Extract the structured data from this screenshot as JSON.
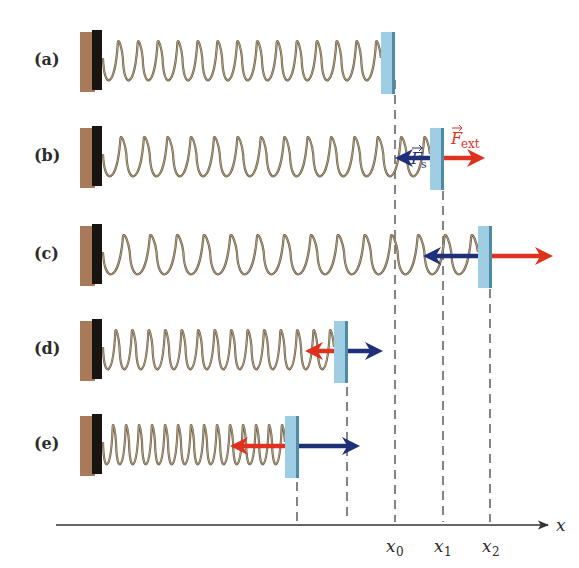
{
  "figure": {
    "colors": {
      "wall_brown": "#a87a5a",
      "wall_dark": "#1a1410",
      "plate_blue": "#9fcde3",
      "plate_edge": "#4f8aa6",
      "spring": "#6b5a40",
      "force_spring_blue": "#1f2f7a",
      "force_ext_red": "#e0301e",
      "axis": "#333333",
      "dashed": "#444444"
    }
  },
  "rows": [
    {
      "label": "(a)",
      "y": 62,
      "plate_x": 387,
      "coils": 14,
      "spring_force": null,
      "ext_force": null
    },
    {
      "label": "(b)",
      "y": 158,
      "plate_x": 436,
      "coils": 14,
      "spring_force": "left",
      "ext_force": "right"
    },
    {
      "label": "(c)",
      "y": 256,
      "plate_x": 484,
      "coils": 14,
      "spring_force": "left",
      "ext_force": "right"
    },
    {
      "label": "(d)",
      "y": 351,
      "plate_x": 340,
      "coils": 14,
      "spring_force": "right",
      "ext_force": "left"
    },
    {
      "label": "(e)",
      "y": 446,
      "plate_x": 291,
      "coils": 14,
      "spring_force": "right",
      "ext_force": "left"
    }
  ],
  "labels": {
    "row_a": "(a)",
    "row_b": "(b)",
    "row_c": "(c)",
    "row_d": "(d)",
    "row_e": "(e)",
    "force_spring": "F",
    "force_spring_sub": "s",
    "force_ext": "F",
    "force_ext_sub": "ext"
  },
  "axis": {
    "label": "x",
    "ticks": [
      {
        "label": "x",
        "sub": "0",
        "x": 395
      },
      {
        "label": "x",
        "sub": "1",
        "x": 443
      },
      {
        "label": "x",
        "sub": "2",
        "x": 490
      }
    ],
    "dashed_x": [
      297,
      347,
      395,
      443,
      490
    ]
  }
}
